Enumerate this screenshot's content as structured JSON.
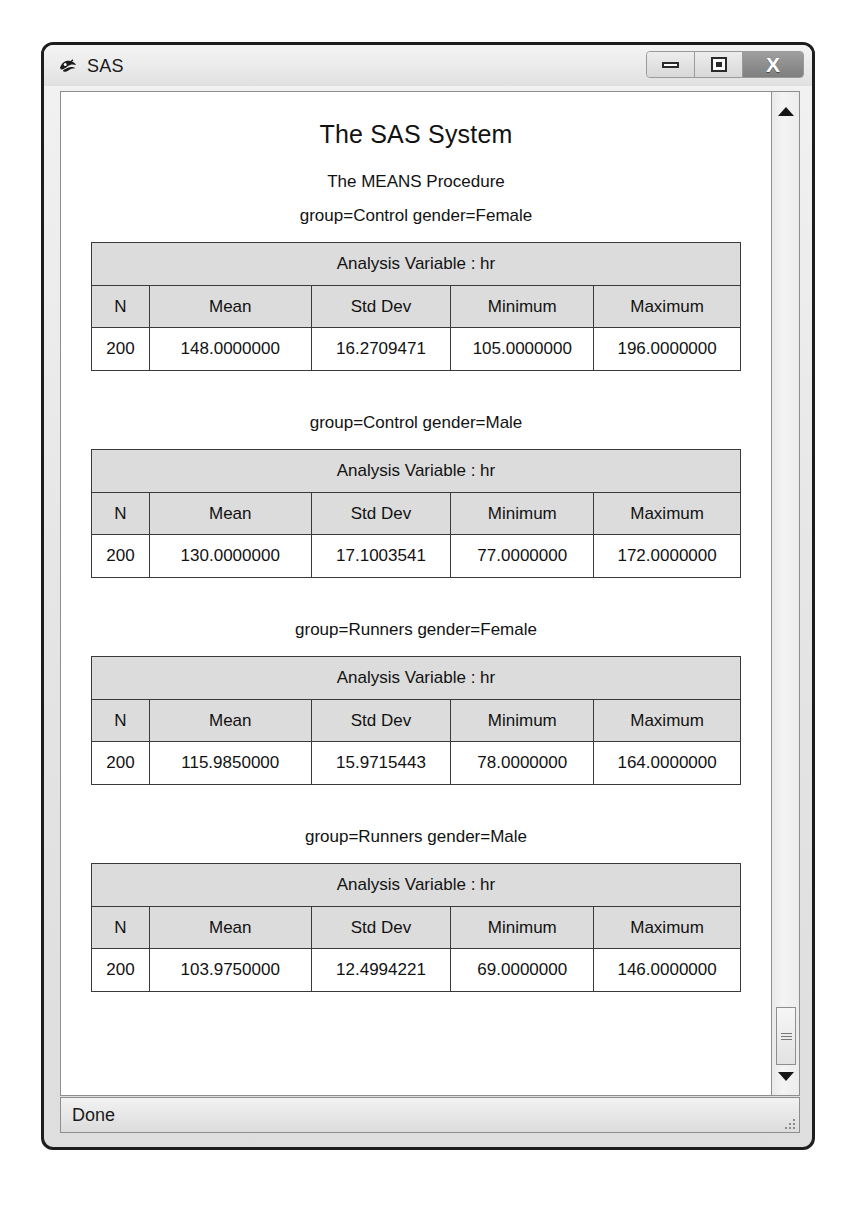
{
  "window": {
    "title": "SAS",
    "app_icon": "sas-logo-icon",
    "controls": {
      "minimize_label": "–",
      "maximize_label": "□",
      "close_label": "X"
    }
  },
  "statusbar": {
    "text": "Done"
  },
  "scrollbar": {
    "up_arrow": "scroll-up-arrow-icon",
    "down_arrow": "scroll-down-arrow-icon",
    "thumb": "scrollbar-thumb"
  },
  "report": {
    "title": "The SAS System",
    "procedure": "The MEANS Procedure",
    "columns": [
      "N",
      "Mean",
      "Std Dev",
      "Minimum",
      "Maximum"
    ],
    "analysis_variable_caption": "Analysis Variable : hr",
    "sections": [
      {
        "by_line": "group=Control gender=Female",
        "caption": "Analysis Variable : hr",
        "values": [
          "200",
          "148.0000000",
          "16.2709471",
          "105.0000000",
          "196.0000000"
        ]
      },
      {
        "by_line": "group=Control gender=Male",
        "caption": "Analysis Variable : hr",
        "values": [
          "200",
          "130.0000000",
          "17.1003541",
          "77.0000000",
          "172.0000000"
        ]
      },
      {
        "by_line": "group=Runners gender=Female",
        "caption": "Analysis Variable : hr",
        "values": [
          "200",
          "115.9850000",
          "15.9715443",
          "78.0000000",
          "164.0000000"
        ]
      },
      {
        "by_line": "group=Runners gender=Male",
        "caption": "Analysis Variable : hr",
        "values": [
          "200",
          "103.9750000",
          "12.4994221",
          "69.0000000",
          "146.0000000"
        ]
      }
    ]
  },
  "colors": {
    "header_fill": "#dcdcdc",
    "border": "#3a3a3a",
    "text": "#121212",
    "close_button": "#7e7e7e"
  }
}
